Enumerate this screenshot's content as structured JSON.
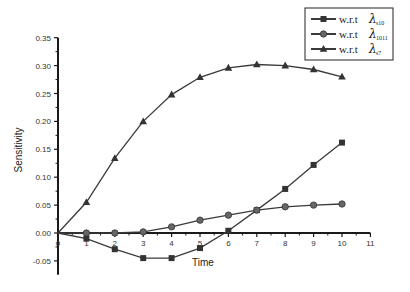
{
  "chart_data": {
    "type": "line",
    "title": "",
    "xlabel": "Time",
    "ylabel": "Sensitivity",
    "xlim": [
      0,
      11
    ],
    "ylim": [
      -0.07,
      0.35
    ],
    "x_ticks": [
      "0",
      "1",
      "2",
      "3",
      "4",
      "5",
      "6",
      "7",
      "8",
      "9",
      "10",
      "11"
    ],
    "y_ticks": [
      "0.35",
      "0.30",
      "0.25",
      "0.20",
      "0.15",
      "0.10",
      "0.05",
      "0.00",
      "-0.05"
    ],
    "grid": false,
    "legend_position": "top-right",
    "x": [
      0,
      1,
      2,
      3,
      4,
      5,
      6,
      7,
      8,
      9,
      10
    ],
    "series": [
      {
        "name": "w.r.t λs10",
        "prefix": "w.r.t",
        "symbol": "λ",
        "subscript": "s10",
        "marker": "square",
        "values": [
          0.0,
          -0.01,
          -0.029,
          -0.045,
          -0.045,
          -0.027,
          0.004,
          0.041,
          0.079,
          0.122,
          0.162
        ]
      },
      {
        "name": "w.r.t λ1011",
        "prefix": "w.r.t",
        "symbol": "λ",
        "subscript": "1011",
        "marker": "circle",
        "values": [
          0.0,
          0.0,
          0.0,
          0.002,
          0.011,
          0.023,
          0.032,
          0.041,
          0.047,
          0.05,
          0.052
        ]
      },
      {
        "name": "w.r.t λs7",
        "prefix": "w.r.t",
        "symbol": "λ",
        "subscript": "s7",
        "marker": "triangle",
        "values": [
          0.0,
          0.055,
          0.134,
          0.2,
          0.248,
          0.279,
          0.296,
          0.302,
          0.3,
          0.293,
          0.28
        ]
      }
    ],
    "colors": {
      "line": "#3a3a3a",
      "axis": "#1a1a1a",
      "text": "#333333"
    }
  }
}
